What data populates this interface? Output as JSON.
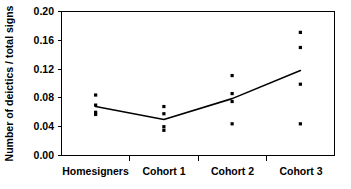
{
  "chart_data": {
    "type": "scatter",
    "title": "",
    "xlabel": "",
    "ylabel": "Number of deictics / total signs",
    "categories": [
      "Homesigners",
      "Cohort 1",
      "Cohort 2",
      "Cohort 3"
    ],
    "ylim": [
      0.0,
      0.2
    ],
    "yticks": [
      0.0,
      0.04,
      0.08,
      0.12,
      0.16,
      0.2
    ],
    "ytick_labels": [
      "0.00",
      "0.04",
      "0.08",
      "0.12",
      "0.16",
      "0.20"
    ],
    "grid": false,
    "legend": "none",
    "series": [
      {
        "name": "Individual participants",
        "marker": "square",
        "points": [
          {
            "category": "Homesigners",
            "values": [
              0.084,
              0.07,
              0.06,
              0.057
            ]
          },
          {
            "category": "Cohort 1",
            "values": [
              0.068,
              0.058,
              0.04,
              0.035
            ]
          },
          {
            "category": "Cohort 2",
            "values": [
              0.111,
              0.086,
              0.075,
              0.044
            ]
          },
          {
            "category": "Cohort 3",
            "values": [
              0.171,
              0.15,
              0.099,
              0.044
            ]
          }
        ]
      },
      {
        "name": "Group mean trend",
        "marker": "line",
        "values": [
          0.068,
          0.05,
          0.079,
          0.118
        ]
      }
    ],
    "colors": {
      "marker": "#000000",
      "line": "#000000",
      "axis": "#000000",
      "background": "#ffffff"
    }
  },
  "axis": {
    "y_label": "Number of deictics / total signs",
    "y_ticks": [
      "0.20",
      "0.16",
      "0.12",
      "0.08",
      "0.04",
      "0.00"
    ],
    "x_ticks": [
      "Homesigners",
      "Cohort 1",
      "Cohort 2",
      "Cohort 3"
    ]
  }
}
